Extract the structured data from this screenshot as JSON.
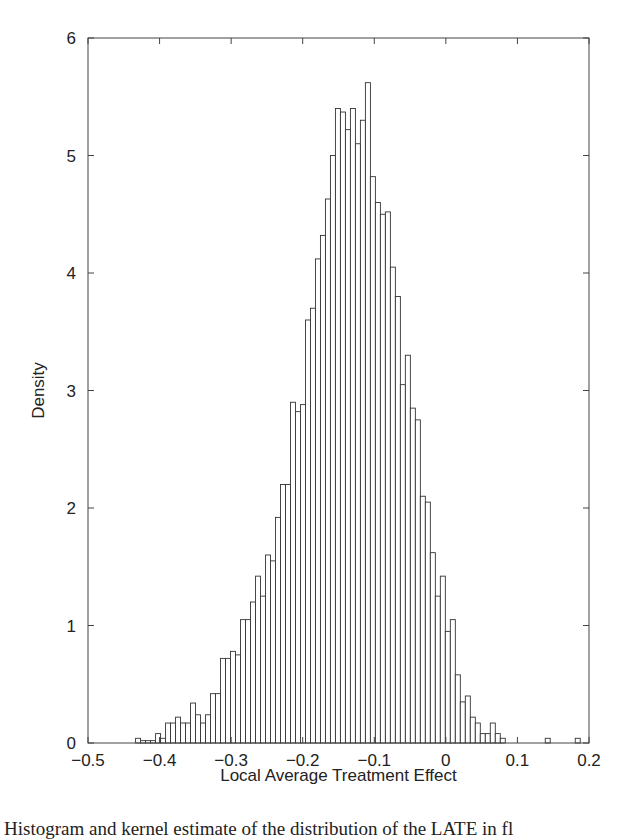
{
  "chart_data": {
    "type": "bar",
    "subtype": "histogram",
    "title": "",
    "xlabel": "Local Average Treatment Effect",
    "ylabel": "Density",
    "xlim": [
      -0.5,
      0.2
    ],
    "ylim": [
      0,
      6
    ],
    "xticks": [
      -0.5,
      -0.4,
      -0.3,
      -0.2,
      -0.1,
      0,
      0.1,
      0.2
    ],
    "xtick_labels": [
      "−0.5",
      "−0.4",
      "−0.3",
      "−0.2",
      "−0.1",
      "0",
      "0.1",
      "0.2"
    ],
    "yticks": [
      0,
      1,
      2,
      3,
      4,
      5,
      6
    ],
    "ytick_labels": [
      "0",
      "1",
      "2",
      "3",
      "4",
      "5",
      "6"
    ],
    "grid": false,
    "legend": null,
    "bar_fill": "#ffffff",
    "bar_edge": "#333333",
    "bin_start": -0.4335,
    "bin_width": 0.00698,
    "values": [
      0.04,
      0.02,
      0.02,
      0.02,
      0.08,
      0.04,
      0.17,
      0.17,
      0.22,
      0.17,
      0.17,
      0.34,
      0.24,
      0.17,
      0.24,
      0.42,
      0.42,
      0.72,
      0.72,
      0.78,
      0.75,
      1.05,
      1.05,
      1.2,
      1.42,
      1.25,
      1.6,
      1.55,
      1.92,
      2.2,
      2.2,
      2.9,
      2.82,
      2.88,
      3.6,
      3.7,
      4.12,
      4.32,
      4.63,
      5.0,
      5.4,
      5.37,
      5.22,
      5.4,
      5.1,
      5.3,
      5.62,
      4.82,
      4.6,
      4.5,
      4.52,
      4.05,
      3.8,
      3.05,
      3.3,
      2.85,
      2.75,
      2.1,
      2.05,
      1.62,
      1.25,
      1.42,
      0.95,
      1.05,
      0.58,
      0.35,
      0.4,
      0.22,
      0.17,
      0.08,
      0.08,
      0.17,
      0.08,
      0.04,
      0.0,
      0.0,
      0.0,
      0.0,
      0.0,
      0.0,
      0.0,
      0.0,
      0.04,
      0.0,
      0.0,
      0.0,
      0.0,
      0.0,
      0.04
    ]
  },
  "caption": "Histogram and kernel estimate of the distribution of the LATE in fl"
}
